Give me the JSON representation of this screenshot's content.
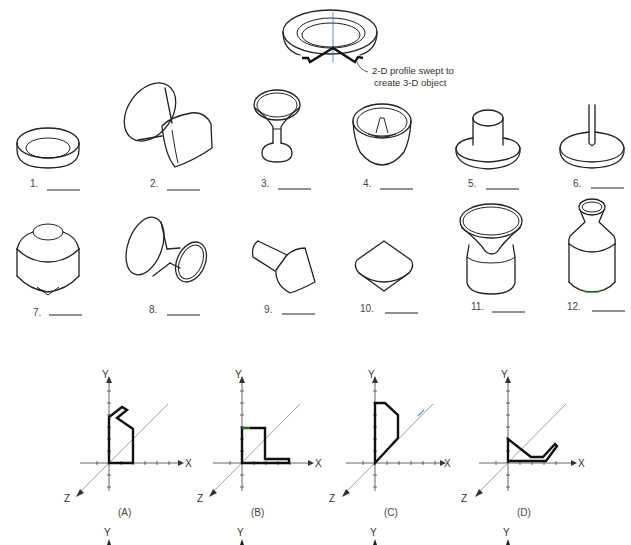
{
  "header_figure": {
    "name": "swept-dish-example",
    "callout_line1": "2-D profile swept to",
    "callout_line2": "create 3-D object"
  },
  "objects": [
    {
      "number": "1.",
      "description": "shallow ring dish"
    },
    {
      "number": "2.",
      "description": "double cone with flared ends"
    },
    {
      "number": "3.",
      "description": "goblet"
    },
    {
      "number": "4.",
      "description": "bundt pan with center cone"
    },
    {
      "number": "5.",
      "description": "cylinder on flat disk"
    },
    {
      "number": "6.",
      "description": "rod on flat disk"
    },
    {
      "number": "7.",
      "description": "cylinder with cone bottom and top boss"
    },
    {
      "number": "8.",
      "description": "double flared funnel"
    },
    {
      "number": "9.",
      "description": "cylinder with conical head"
    },
    {
      "number": "10.",
      "description": "double cone spindle"
    },
    {
      "number": "11.",
      "description": "cylinder with flared funnel top"
    },
    {
      "number": "12.",
      "description": "bottle with flared neck"
    }
  ],
  "profiles": [
    {
      "label": "(A)",
      "x_axis": "X",
      "y_axis": "Y",
      "z_axis": "Z"
    },
    {
      "label": "(B)",
      "x_axis": "X",
      "y_axis": "Y",
      "z_axis": "Z"
    },
    {
      "label": "(C)",
      "x_axis": "X",
      "y_axis": "Y",
      "z_axis": "Z"
    },
    {
      "label": "(D)",
      "x_axis": "X",
      "y_axis": "Y",
      "z_axis": "Z"
    }
  ],
  "next_row_axes": [
    {
      "y_axis": "Y"
    },
    {
      "y_axis": "Y"
    },
    {
      "y_axis": "Y"
    },
    {
      "y_axis": "Y"
    }
  ],
  "colors": {
    "line": "#222222",
    "profile_highlight": "#1a2a5a",
    "center_axis": "#3a6fd0",
    "background": "#ffffff"
  }
}
